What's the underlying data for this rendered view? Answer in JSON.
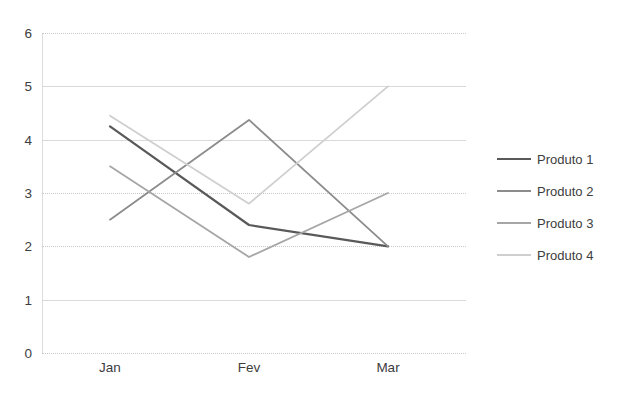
{
  "chart_data": {
    "type": "line",
    "title": "",
    "xlabel": "",
    "ylabel": "",
    "categories": [
      "Jan",
      "Fev",
      "Mar"
    ],
    "ylim": [
      0,
      6
    ],
    "yticks": [
      0,
      1,
      2,
      3,
      4,
      5,
      6
    ],
    "ytick_labels": [
      "0",
      "1",
      "2",
      "3",
      "4",
      "5",
      "6"
    ],
    "grid": true,
    "legend_position": "right",
    "series": [
      {
        "name": "Produto 1",
        "values": [
          4.25,
          2.4,
          2.0
        ],
        "color": "#595959"
      },
      {
        "name": "Produto 2",
        "values": [
          2.5,
          4.37,
          2.0
        ],
        "color": "#8c8c8c"
      },
      {
        "name": "Produto 3",
        "values": [
          3.5,
          1.8,
          3.0
        ],
        "color": "#a6a6a6"
      },
      {
        "name": "Produto 4",
        "values": [
          4.45,
          2.8,
          5.0
        ],
        "color": "#cfcfcf"
      }
    ]
  },
  "axes": {
    "y_labels": [
      "6",
      "5",
      "4",
      "3",
      "2",
      "1",
      "0"
    ],
    "x_labels": [
      "Jan",
      "Fev",
      "Mar"
    ]
  },
  "legend": {
    "items": [
      {
        "label": "Produto 1"
      },
      {
        "label": "Produto 2"
      },
      {
        "label": "Produto 3"
      },
      {
        "label": "Produto 4"
      }
    ]
  },
  "colors": {
    "grid": "#d9d9d9",
    "text": "#3d3d3d",
    "background": "#ffffff"
  }
}
